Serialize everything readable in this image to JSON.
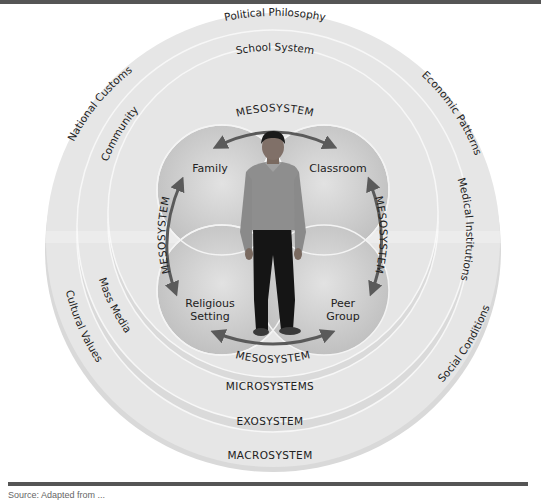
{
  "diagram": {
    "macrosystem": {
      "label": "MACROSYSTEM",
      "items": [
        "Political Philosophy",
        "Economic Patterns",
        "Social Conditions",
        "Cultural Values",
        "National Customs"
      ]
    },
    "exosystem": {
      "label": "EXOSYSTEM",
      "items": [
        "School System",
        "Medical Institutions",
        "Mass Media",
        "Community"
      ]
    },
    "microsystems": {
      "label": "MICROSYSTEMS",
      "settings": [
        "Family",
        "Classroom",
        "Religious",
        "Setting",
        "Peer",
        "Group"
      ]
    },
    "mesosystem": {
      "label": "MESOSYSTEM",
      "top": "MESOSYSTEM",
      "bottom": "MESOSYSTEM",
      "left": "MESOSYSTEM",
      "right": "MESOSYSTEM"
    },
    "center": "person",
    "colors": {
      "outer_ring": "#e4e4e4",
      "ring_line": "#f8f8f8",
      "micro_lobes": "#cfcfcf",
      "arrow": "#5a5a5a",
      "text": "#222222"
    }
  },
  "footer": {
    "source": "Source: Adapted from ..."
  }
}
